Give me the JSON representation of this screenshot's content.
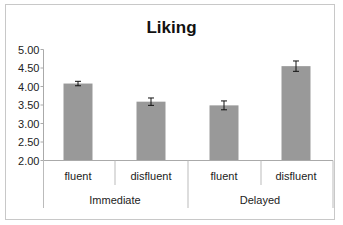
{
  "chart_data": {
    "type": "bar",
    "title": "Liking",
    "xlabel": "",
    "ylabel": "",
    "ylim": [
      2.0,
      5.0
    ],
    "yticks": [
      "5.00",
      "4.50",
      "4.00",
      "3.50",
      "3.00",
      "2.50",
      "2.00"
    ],
    "grid": false,
    "legend": null,
    "categories": [
      "fluent",
      "disfluent",
      "fluent",
      "disfluent"
    ],
    "groups": [
      {
        "name": "Immediate",
        "categories": [
          "fluent",
          "disfluent"
        ]
      },
      {
        "name": "Delayed",
        "categories": [
          "fluent",
          "disfluent"
        ]
      }
    ],
    "values": [
      4.08,
      3.59,
      3.49,
      4.55
    ],
    "error_bars": [
      0.06,
      0.1,
      0.12,
      0.14
    ],
    "bar_color": "#999999"
  },
  "title": "Liking",
  "labels": {
    "cat1": "fluent",
    "cat2": "disfluent",
    "cat3": "fluent",
    "cat4": "disfluent",
    "group1": "Immediate",
    "group2": "Delayed"
  },
  "yticks": [
    "5.00",
    "4.50",
    "4.00",
    "3.50",
    "3.00",
    "2.50",
    "2.00"
  ]
}
